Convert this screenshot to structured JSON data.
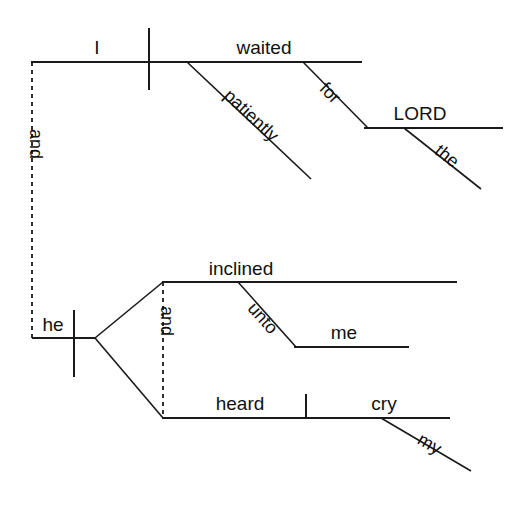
{
  "diagram": {
    "type": "reed-kellogg-sentence-diagram",
    "sentence": "I waited patiently for the LORD; and he inclined unto me, and heard my cry",
    "ink_color": "#1a1a1a",
    "background_color": "#ffffff",
    "clauses": [
      {
        "id": "clause-1",
        "subject": "I",
        "verb": "waited",
        "modifiers": [
          {
            "word": "patiently",
            "attaches_to": "waited",
            "kind": "adverb"
          },
          {
            "word": "for",
            "attaches_to": "waited",
            "kind": "preposition"
          },
          {
            "word": "LORD",
            "attaches_to": "for",
            "kind": "object-of-preposition"
          },
          {
            "word": "the",
            "attaches_to": "LORD",
            "kind": "article"
          }
        ]
      },
      {
        "id": "clause-2",
        "subject": "he",
        "conjunction": "and",
        "verbs": [
          "inclined",
          "heard"
        ],
        "modifiers": [
          {
            "word": "unto",
            "attaches_to": "inclined",
            "kind": "preposition"
          },
          {
            "word": "me",
            "attaches_to": "unto",
            "kind": "object-of-preposition"
          },
          {
            "word": "cry",
            "attaches_to": "heard",
            "kind": "direct-object"
          },
          {
            "word": "my",
            "attaches_to": "cry",
            "kind": "possessive"
          }
        ]
      }
    ],
    "connector": {
      "word": "and",
      "style": "dashed",
      "joins": [
        "clause-1",
        "clause-2"
      ]
    },
    "labels": {
      "subject_1": "I",
      "verb_1": "waited",
      "adverb_1": "patiently",
      "prep_1": "for",
      "prep_obj_1": "LORD",
      "article_1": "the",
      "connector": "and",
      "subject_2": "he",
      "verb_2a": "inclined",
      "prep_2": "unto",
      "prep_obj_2": "me",
      "inner_connector": "and",
      "verb_2b": "heard",
      "dobj_2": "cry",
      "possessive_2": "my"
    }
  }
}
